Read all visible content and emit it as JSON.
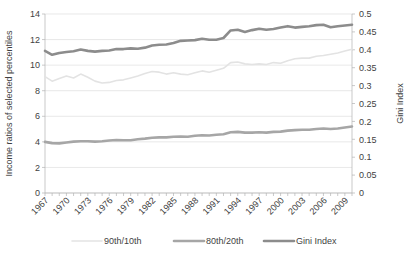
{
  "chart_data": {
    "type": "line",
    "title": "",
    "xlabel": "",
    "ylabel": "Income ratios of selected percentiles",
    "y2label": "Gini Index",
    "ylim": [
      0,
      14
    ],
    "y2lim": [
      0,
      0.5
    ],
    "yticks": [
      "0",
      "2",
      "4",
      "6",
      "8",
      "10",
      "12",
      "14"
    ],
    "y2ticks": [
      "0",
      "0.05",
      "0.1",
      "0.15",
      "0.2",
      "0.25",
      "0.3",
      "0.35",
      "0.4",
      "0.45",
      "0.5"
    ],
    "grid": true,
    "legend_position": "bottom",
    "x": [
      1967,
      1968,
      1969,
      1970,
      1971,
      1972,
      1973,
      1974,
      1975,
      1976,
      1977,
      1978,
      1979,
      1980,
      1981,
      1982,
      1983,
      1984,
      1985,
      1986,
      1987,
      1988,
      1989,
      1990,
      1991,
      1992,
      1993,
      1994,
      1995,
      1996,
      1997,
      1998,
      1999,
      2000,
      2001,
      2002,
      2003,
      2004,
      2005,
      2006,
      2007,
      2008,
      2009,
      2010
    ],
    "xtick_labels": [
      "1967",
      "1970",
      "1973",
      "1976",
      "1979",
      "1982",
      "1985",
      "1988",
      "1991",
      "1994",
      "1997",
      "2000",
      "2003",
      "2006",
      "2009"
    ],
    "xtick_step": 3,
    "series": [
      {
        "name": "90th/10th",
        "color": "#e3e3e3",
        "axis": "left",
        "width": 1.6,
        "values": [
          9.1,
          8.75,
          8.95,
          9.15,
          9.0,
          9.3,
          9.05,
          8.75,
          8.6,
          8.65,
          8.8,
          8.85,
          9.0,
          9.15,
          9.35,
          9.5,
          9.45,
          9.3,
          9.4,
          9.3,
          9.25,
          9.4,
          9.55,
          9.45,
          9.6,
          9.75,
          10.2,
          10.25,
          10.1,
          10.05,
          10.1,
          10.05,
          10.2,
          10.15,
          10.35,
          10.5,
          10.55,
          10.55,
          10.7,
          10.75,
          10.85,
          10.95,
          11.1,
          11.25
        ]
      },
      {
        "name": "80th/20th",
        "color": "#a6a6a6",
        "axis": "left",
        "width": 2.6,
        "values": [
          4.0,
          3.9,
          3.88,
          3.95,
          4.02,
          4.05,
          4.05,
          4.02,
          4.05,
          4.1,
          4.15,
          4.12,
          4.12,
          4.2,
          4.25,
          4.32,
          4.35,
          4.35,
          4.4,
          4.42,
          4.4,
          4.48,
          4.52,
          4.5,
          4.55,
          4.6,
          4.75,
          4.78,
          4.72,
          4.72,
          4.75,
          4.72,
          4.78,
          4.8,
          4.88,
          4.92,
          4.95,
          4.95,
          5.0,
          5.05,
          5.0,
          5.05,
          5.12,
          5.2
        ]
      },
      {
        "name": "Gini Index",
        "color": "#8c8c8c",
        "axis": "right",
        "width": 2.6,
        "values": [
          0.397,
          0.386,
          0.391,
          0.394,
          0.396,
          0.401,
          0.397,
          0.395,
          0.397,
          0.398,
          0.402,
          0.402,
          0.404,
          0.403,
          0.406,
          0.412,
          0.414,
          0.415,
          0.419,
          0.425,
          0.426,
          0.427,
          0.431,
          0.428,
          0.428,
          0.433,
          0.454,
          0.456,
          0.45,
          0.455,
          0.459,
          0.456,
          0.458,
          0.462,
          0.466,
          0.462,
          0.464,
          0.466,
          0.469,
          0.47,
          0.463,
          0.466,
          0.468,
          0.47
        ]
      }
    ],
    "legend": [
      {
        "label": "90th/10th",
        "color": "#e3e3e3"
      },
      {
        "label": "80th/20th",
        "color": "#a6a6a6"
      },
      {
        "label": "Gini Index",
        "color": "#8c8c8c"
      }
    ]
  }
}
